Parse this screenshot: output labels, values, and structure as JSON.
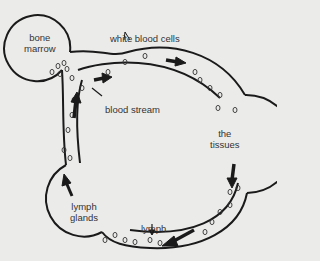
{
  "diagram": {
    "type": "flow-cycle",
    "colors": {
      "background": "#ebebea",
      "line": "#1a1a1a",
      "text": "#333333"
    },
    "nodes": {
      "bone_marrow": {
        "line1": "bone",
        "line2": "marrow"
      },
      "tissues": {
        "line1": "the",
        "line2": "tissues"
      },
      "lymph_glands": {
        "line1": "lymph",
        "line2": "glands"
      }
    },
    "labels": {
      "white_blood_cells": "white blood cells",
      "blood_stream": "blood stream",
      "lymph": "lymph"
    },
    "flow": [
      "bone marrow",
      "blood stream",
      "the tissues",
      "lymph",
      "lymph glands",
      "blood stream"
    ]
  }
}
